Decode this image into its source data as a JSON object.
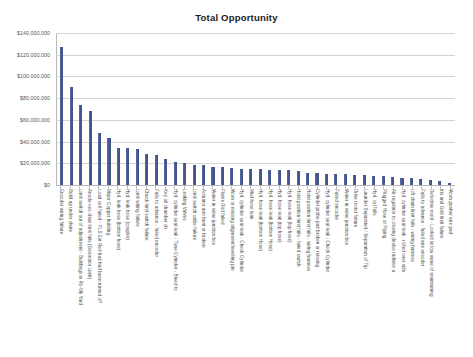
{
  "chart_data": {
    "type": "bar",
    "title": "Total Opportunity",
    "xlabel": "",
    "ylabel": "",
    "ylim": [
      0,
      140000000
    ],
    "grid": true,
    "legend": "none",
    "orientation": "vertical",
    "bar_color": "#4a5c96",
    "y_ticks": [
      "$0",
      "$20,000,000",
      "$40,000,000",
      "$60,000,000",
      "$80,000,000",
      "$100,000,000",
      "$120,000,000",
      "$140,000,000"
    ],
    "y_tick_values": [
      0,
      20000000,
      40000000,
      60000000,
      80000000,
      100000000,
      120000000,
      140000000
    ],
    "categories": [
      "Encoder wiring failure",
      "Build up under chute",
      "Limit switch out of adjustment - Buildings in Ro-Vik Yard",
      "Anode-ceo chair limit fails (Geomator Limit)",
      "Load cell failed - PLS Ext Red had had been turned off",
      "Major Copper building",
      "Hyd. leak hose (bottom hose)",
      "Hyd. leak hose (coupler)",
      "Limit wiring failure",
      "Chuck limit switch failure",
      "Fails to advance - failed encoder",
      "Key oil chamber ch",
      "Hyd. cylinder seal leak - Tune Cylinder - Bleed to",
      "Leaking Valves",
      "Limit switch cable failure",
      "Actuator arm bent or broken",
      "Water in valve junction box",
      "Flame Rod failed",
      "Worn or missing alignment/levelling pin",
      "Hyd. cylinder seal leak - Check Cylinder",
      "Mud hose leak",
      "Hyd. hose leak (bottom Hose)",
      "Hyd. hose leak (bottom Hose)",
      "Hyd. hose leak (top hose)",
      "Hyd. hose leak (top hose)",
      "Hoist position limit fails - failed switch",
      "Hoist position limit fails - wiring harness",
      "Cylinder probe pad broken or missing",
      "Hyd. cylinder seal leak - Check Cylinder",
      "Failed encoder",
      "Water in valve junction box",
      "Drive motor failure",
      "Launder Separated / Separation of Tip",
      "Hyd. cyl falls",
      "Plugged Hose or Piping",
      "Air regulator to closing device radiator a",
      "Hyd. cylinder seal leak - rolled over side",
      "Lift chain limit fails - wiring harness",
      "Fails to advance - failed arm encoder",
      "Defective mold - Looked at low value of maintaining",
      "Iris and Grid limit failure",
      "Worn pusher arm pad"
    ],
    "values": [
      127500000,
      90500000,
      74000000,
      68500000,
      47500000,
      43500000,
      34500000,
      34500000,
      33500000,
      29000000,
      27500000,
      24000000,
      21500000,
      20000000,
      18800000,
      18200000,
      16800000,
      16500000,
      15800000,
      15200000,
      14800000,
      14500000,
      14200000,
      13800000,
      13500000,
      12500000,
      11200000,
      10800000,
      10500000,
      10200000,
      9800000,
      9400000,
      9000000,
      8500000,
      8000000,
      7400000,
      6800000,
      6200000,
      5400000,
      4500000,
      3400000,
      2200000
    ]
  }
}
